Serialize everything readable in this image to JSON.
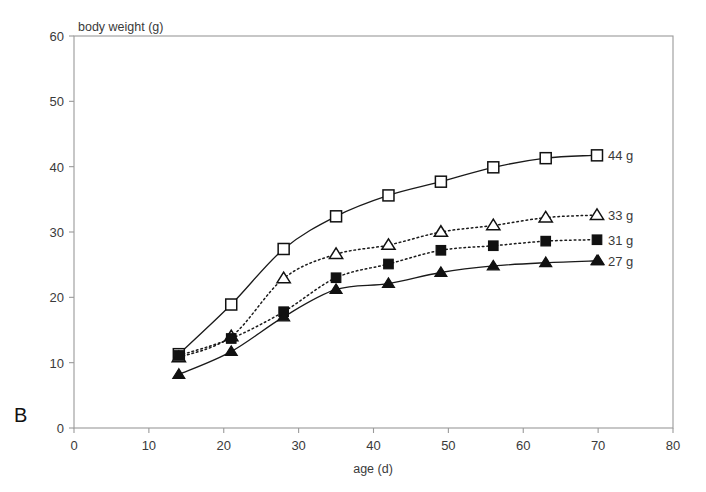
{
  "panel": {
    "label": "B"
  },
  "chart_data": {
    "type": "line",
    "title": "",
    "subtitle": "",
    "xlabel": "age (d)",
    "ylabel": "body weight (g)",
    "xlim": [
      0,
      80
    ],
    "ylim": [
      0,
      60
    ],
    "xticks": [
      0,
      10,
      20,
      30,
      40,
      50,
      60,
      70,
      80
    ],
    "yticks": [
      0,
      10,
      20,
      30,
      40,
      50,
      60
    ],
    "grid": false,
    "legend_position": "right-inline-at-line-ends",
    "series": [
      {
        "name": "44 g",
        "label": "44 g",
        "marker": "open-square",
        "linestyle": "solid",
        "color": "#111111",
        "x": [
          14,
          21,
          28,
          35,
          42,
          49,
          56,
          63
        ],
        "y": [
          11.3,
          18.9,
          27.4,
          32.4,
          35.6,
          37.7,
          39.9,
          41.3
        ]
      },
      {
        "name": "33 g",
        "label": "33 g",
        "marker": "open-triangle",
        "linestyle": "dotted",
        "color": "#111111",
        "x": [
          14,
          21,
          28,
          35,
          42,
          49,
          56,
          63
        ],
        "y": [
          10.8,
          14.0,
          22.9,
          26.6,
          28.0,
          30.0,
          31.0,
          32.2
        ]
      },
      {
        "name": "31 g",
        "label": "31 g",
        "marker": "filled-square",
        "linestyle": "dotted",
        "color": "#111111",
        "x": [
          14,
          21,
          28,
          35,
          42,
          49,
          56,
          63
        ],
        "y": [
          11.1,
          13.7,
          17.8,
          23.0,
          25.1,
          27.2,
          27.9,
          28.6
        ]
      },
      {
        "name": "27 g",
        "label": "27 g",
        "marker": "filled-triangle",
        "linestyle": "solid",
        "color": "#111111",
        "x": [
          14,
          21,
          28,
          35,
          42,
          49,
          56,
          63,
          70
        ],
        "y": [
          8.2,
          11.7,
          17.0,
          21.2,
          22.1,
          23.8,
          24.8,
          25.3,
          25.6
        ]
      }
    ]
  }
}
